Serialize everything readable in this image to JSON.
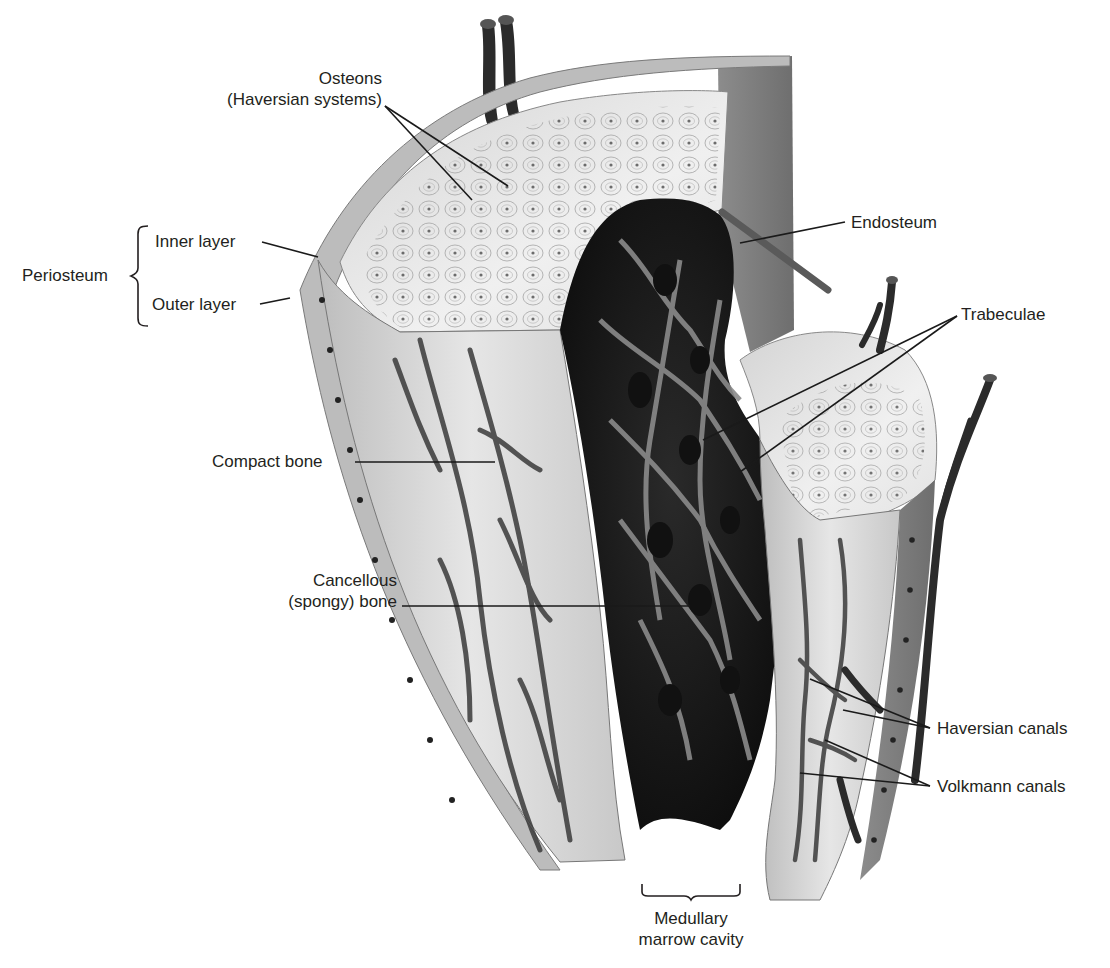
{
  "figure": {
    "colors": {
      "background": "#ffffff",
      "text": "#231f20",
      "leader_line": "#1a1a1a",
      "compact_bone": "#d9d9d9",
      "compact_bone_light": "#ececec",
      "canal": "#3a3a3a",
      "spongy_dark": "#1c1c1c",
      "trabecula": "#8a8a8a",
      "periosteum": "#9a9a9a",
      "vessel": "#2b2b2b"
    }
  },
  "labels": {
    "osteons": {
      "line1": "Osteons",
      "line2": "(Haversian systems)"
    },
    "periosteum": {
      "group": "Periosteum",
      "inner": "Inner layer",
      "outer": "Outer layer"
    },
    "endosteum": "Endosteum",
    "trabeculae": "Trabeculae",
    "compact_bone": "Compact bone",
    "cancellous": {
      "line1": "Cancellous",
      "line2": "(spongy) bone"
    },
    "haversian_canals": "Haversian canals",
    "volkmann_canals": "Volkmann canals",
    "medullary": {
      "line1": "Medullary",
      "line2": "marrow cavity"
    }
  },
  "leaders": [
    {
      "name": "osteons-leader-1",
      "x1": 385,
      "y1": 106,
      "x2": 472,
      "y2": 200
    },
    {
      "name": "osteons-leader-2",
      "x1": 385,
      "y1": 106,
      "x2": 508,
      "y2": 186
    },
    {
      "name": "inner-layer-leader",
      "x1": 262,
      "y1": 242,
      "x2": 318,
      "y2": 257
    },
    {
      "name": "outer-layer-leader",
      "x1": 260,
      "y1": 304,
      "x2": 290,
      "y2": 298
    },
    {
      "name": "endosteum-leader",
      "x1": 845,
      "y1": 222,
      "x2": 740,
      "y2": 243
    },
    {
      "name": "trabeculae-leader-1",
      "x1": 957,
      "y1": 316,
      "x2": 703,
      "y2": 440
    },
    {
      "name": "trabeculae-leader-2",
      "x1": 957,
      "y1": 316,
      "x2": 740,
      "y2": 472
    },
    {
      "name": "compact-bone-leader",
      "x1": 355,
      "y1": 462,
      "x2": 495,
      "y2": 462
    },
    {
      "name": "cancellous-leader",
      "x1": 402,
      "y1": 606,
      "x2": 690,
      "y2": 606
    },
    {
      "name": "haversian-leader-1",
      "x1": 930,
      "y1": 728,
      "x2": 810,
      "y2": 679
    },
    {
      "name": "haversian-leader-2",
      "x1": 930,
      "y1": 728,
      "x2": 843,
      "y2": 710
    },
    {
      "name": "volkmann-leader-1",
      "x1": 930,
      "y1": 786,
      "x2": 825,
      "y2": 740
    },
    {
      "name": "volkmann-leader-2",
      "x1": 930,
      "y1": 786,
      "x2": 800,
      "y2": 773
    }
  ]
}
